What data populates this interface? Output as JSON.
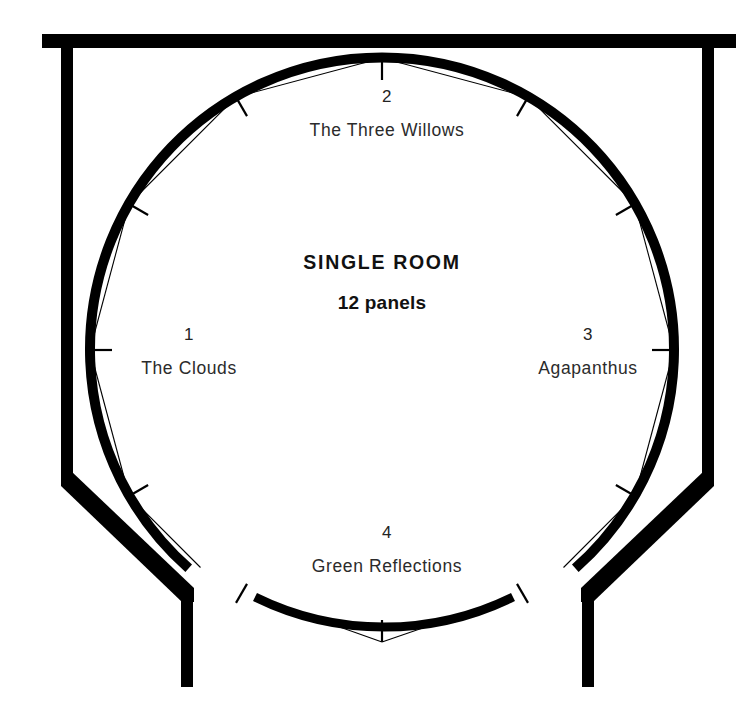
{
  "diagram": {
    "center": {
      "title": "SINGLE ROOM",
      "subtitle": "12 panels"
    },
    "panels": [
      {
        "number": "1",
        "title": "The Clouds"
      },
      {
        "number": "2",
        "title": "The Three Willows"
      },
      {
        "number": "3",
        "title": "Agapanthus"
      },
      {
        "number": "4",
        "title": "Green Reflections"
      }
    ],
    "colors": {
      "ink": "#000000",
      "background": "#ffffff",
      "label": "#2b2b2b"
    },
    "geometry": {
      "circle_center_x": 382,
      "circle_center_y": 350,
      "circle_radius": 292,
      "panel_count": 12,
      "wall_top_y": 41,
      "wall_left_x": 68,
      "wall_right_x": 713
    }
  }
}
